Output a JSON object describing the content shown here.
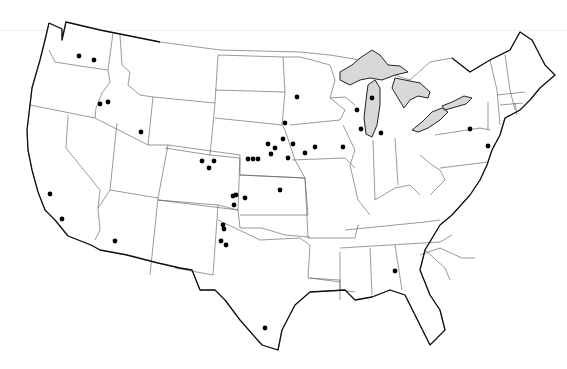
{
  "map": {
    "title": "",
    "colors": {
      "background": "#ffffff",
      "land": "#ffffff",
      "lakes": "#d8d8d8",
      "borders": "#555555",
      "coastline": "#111111",
      "markers": "#000000"
    },
    "marker_radius": 2.4,
    "markers": [
      {
        "region": "Washington",
        "x": 79,
        "y": 56
      },
      {
        "region": "Washington",
        "x": 94,
        "y": 60
      },
      {
        "region": "Idaho",
        "x": 100,
        "y": 104
      },
      {
        "region": "Idaho",
        "x": 108,
        "y": 102
      },
      {
        "region": "Utah/Wyoming",
        "x": 141,
        "y": 132
      },
      {
        "region": "California",
        "x": 50,
        "y": 194
      },
      {
        "region": "California",
        "x": 62,
        "y": 219
      },
      {
        "region": "Arizona",
        "x": 115,
        "y": 241
      },
      {
        "region": "Colorado",
        "x": 202,
        "y": 161
      },
      {
        "region": "Colorado",
        "x": 209,
        "y": 168
      },
      {
        "region": "Colorado",
        "x": 214,
        "y": 161
      },
      {
        "region": "Nebraska",
        "x": 248,
        "y": 159
      },
      {
        "region": "Nebraska",
        "x": 253,
        "y": 159
      },
      {
        "region": "Nebraska",
        "x": 258,
        "y": 159
      },
      {
        "region": "Nebraska",
        "x": 268,
        "y": 144
      },
      {
        "region": "Nebraska",
        "x": 275,
        "y": 148
      },
      {
        "region": "Nebraska",
        "x": 271,
        "y": 154
      },
      {
        "region": "Nebraska",
        "x": 288,
        "y": 158
      },
      {
        "region": "South Dakota",
        "x": 285,
        "y": 123
      },
      {
        "region": "Minnesota",
        "x": 297,
        "y": 97
      },
      {
        "region": "Iowa",
        "x": 283,
        "y": 139
      },
      {
        "region": "Iowa",
        "x": 293,
        "y": 144
      },
      {
        "region": "Iowa",
        "x": 305,
        "y": 153
      },
      {
        "region": "Iowa",
        "x": 315,
        "y": 147
      },
      {
        "region": "Illinois",
        "x": 343,
        "y": 147
      },
      {
        "region": "Kansas",
        "x": 280,
        "y": 190
      },
      {
        "region": "Kansas",
        "x": 233,
        "y": 196
      },
      {
        "region": "Kansas",
        "x": 236,
        "y": 195
      },
      {
        "region": "Kansas",
        "x": 245,
        "y": 198
      },
      {
        "region": "Kansas",
        "x": 234,
        "y": 205
      },
      {
        "region": "New Mexico",
        "x": 223,
        "y": 225
      },
      {
        "region": "New Mexico",
        "x": 224,
        "y": 229
      },
      {
        "region": "New Mexico",
        "x": 221,
        "y": 241
      },
      {
        "region": "New Mexico",
        "x": 226,
        "y": 245
      },
      {
        "region": "Texas",
        "x": 265,
        "y": 328
      },
      {
        "region": "Wisconsin",
        "x": 357,
        "y": 110
      },
      {
        "region": "Wisconsin",
        "x": 361,
        "y": 129
      },
      {
        "region": "Wisconsin",
        "x": 372,
        "y": 98
      },
      {
        "region": "Michigan",
        "x": 381,
        "y": 133
      },
      {
        "region": "Pennsylvania",
        "x": 470,
        "y": 129
      },
      {
        "region": "New Jersey",
        "x": 488,
        "y": 146
      },
      {
        "region": "Alabama",
        "x": 395,
        "y": 271
      }
    ]
  }
}
